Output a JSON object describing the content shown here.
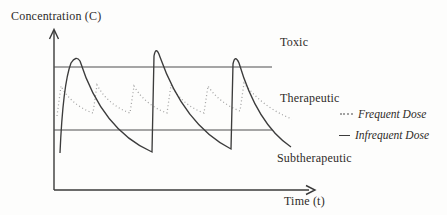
{
  "colors": {
    "background": "#fdfdfc",
    "axis": "#3a3a3a",
    "threshold_line": "#4e4e4e",
    "frequent_dose_line": "#a2a2a2",
    "infrequent_dose_line": "#3c3c3c",
    "text": "#2e2b28"
  },
  "icons": {
    "y_axis_arrow": "up-arrowhead-icon",
    "x_axis_arrow": "right-arrowhead-icon",
    "legend_frequent_marker": "dotted-line-marker-icon",
    "legend_infrequent_marker": "solid-line-marker-icon"
  },
  "chart_data": {
    "type": "line",
    "title": "",
    "xlabel": "Time (t)",
    "ylabel": "Concentration (C)",
    "axes_numeric": false,
    "grid": false,
    "legend_position": "right",
    "units": "pixel coordinates of the drawing; y increases downward",
    "axes": {
      "y_axis": {
        "x": 54,
        "y_top": 31,
        "y_bottom": 190
      },
      "x_axis": {
        "y": 190,
        "x_left": 54,
        "x_right": 309
      }
    },
    "thresholds": [
      {
        "name": "toxic-threshold",
        "meaning": "upper limit of therapeutic window",
        "y": 67,
        "x1": 54,
        "x2": 272
      },
      {
        "name": "subtherapeutic-threshold",
        "meaning": "lower limit of therapeutic window",
        "y": 130,
        "x1": 54,
        "x2": 272
      }
    ],
    "zones": [
      {
        "label": "Toxic",
        "position": "above toxic threshold line"
      },
      {
        "label": "Therapeutic",
        "position": "between the two threshold lines"
      },
      {
        "label": "Subtherapeutic",
        "position": "below subtherapeutic threshold line"
      }
    ],
    "series": [
      {
        "name": "Frequent Dose",
        "line_style": "dotted",
        "color_key": "frequent_dose_line",
        "behavior": "small repeated doses; concentration oscillates with low amplitude and stays inside the therapeutic window",
        "points": [
          {
            "x": 57,
            "y": 116
          },
          {
            "x": 61,
            "y": 86
          },
          {
            "x": 93,
            "y": 113,
            "cx": 71,
            "cy": 105
          },
          {
            "x": 97,
            "y": 85
          },
          {
            "x": 130,
            "y": 113,
            "cx": 108,
            "cy": 105
          },
          {
            "x": 134,
            "y": 86
          },
          {
            "x": 167,
            "y": 113,
            "cx": 145,
            "cy": 105
          },
          {
            "x": 171,
            "y": 85
          },
          {
            "x": 204,
            "y": 113,
            "cx": 182,
            "cy": 105
          },
          {
            "x": 208,
            "y": 86
          },
          {
            "x": 240,
            "y": 111,
            "cx": 219,
            "cy": 103
          },
          {
            "x": 244,
            "y": 83
          },
          {
            "x": 292,
            "y": 119,
            "cx": 262,
            "cy": 107
          }
        ]
      },
      {
        "name": "Infrequent Dose",
        "line_style": "solid",
        "color_key": "infrequent_dose_line",
        "behavior": "three large spaced doses; peaks rise above the toxic line and troughs fall below the subtherapeutic line",
        "points": [
          {
            "x": 60,
            "y": 153
          },
          {
            "x": 71,
            "y": 63,
            "cx": 63,
            "cy": 84
          },
          {
            "x": 80,
            "y": 61,
            "cx": 76,
            "cy": 55
          },
          {
            "x": 152,
            "y": 152,
            "cx": 102,
            "cy": 130
          },
          {
            "x": 154,
            "y": 56
          },
          {
            "x": 160,
            "y": 57,
            "cx": 156,
            "cy": 45
          },
          {
            "x": 231,
            "y": 149,
            "cx": 184,
            "cy": 125
          },
          {
            "x": 233,
            "y": 64
          },
          {
            "x": 239,
            "y": 63,
            "cx": 235,
            "cy": 54
          },
          {
            "x": 291,
            "y": 147,
            "cx": 257,
            "cy": 124
          }
        ]
      }
    ]
  }
}
